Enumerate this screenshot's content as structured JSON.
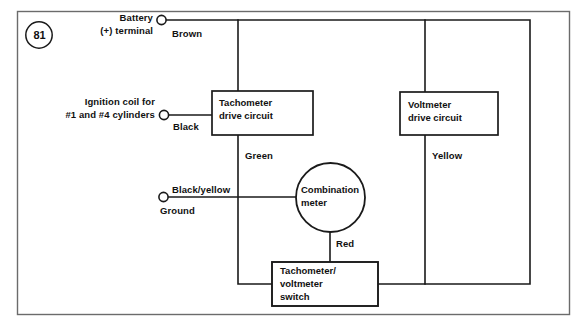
{
  "figure": {
    "number": "81"
  },
  "boxes": {
    "tachometer_drive": {
      "line1": "Tachometer",
      "line2": "drive circuit"
    },
    "voltmeter_drive": {
      "line1": "Voltmeter",
      "line2": "drive circuit"
    },
    "switch": {
      "line1": "Tachometer/",
      "line2": "voltmeter",
      "line3": "switch"
    },
    "combination_meter": {
      "line1": "Combination",
      "line2": "meter"
    }
  },
  "terminals": {
    "battery": {
      "line1": "Battery",
      "line2": "(+) terminal"
    },
    "ignition_coil": {
      "line1": "Ignition coil for",
      "line2": "#1 and #4 cylinders"
    },
    "ground": {
      "label": "Ground"
    }
  },
  "wire_colors": {
    "brown": "Brown",
    "black": "Black",
    "green": "Green",
    "yellow": "Yellow",
    "red": "Red",
    "black_yellow": "Black/yellow"
  },
  "style": {
    "line_color": "#1a1a1a",
    "border_color": "#6b6b6b",
    "text_color": "#111111",
    "background": "#ffffff"
  }
}
